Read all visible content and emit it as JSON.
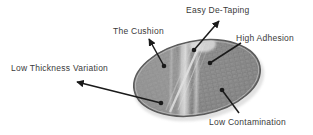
{
  "figure": {
    "background_color": "#ffffff",
    "text_color": "#3a3a3a",
    "leader_line_color": "#1a1a1a",
    "wafer": {
      "fill_color": "#9a9a9a",
      "edge_color": "#4d4d4d",
      "tape_highlight_color": "#f2f2f2",
      "die_grid_color": "#7a7a7a"
    }
  },
  "callouts": [
    {
      "id": "easy-de-taping",
      "label": "Easy De-Taping",
      "arrow_from": {
        "x": 194,
        "y": 50
      },
      "arrow_to": {
        "x": 219,
        "y": 21
      }
    },
    {
      "id": "the-cushion",
      "label": "The Cushion",
      "arrow_from": {
        "x": 164,
        "y": 66
      },
      "arrow_to": {
        "x": 149,
        "y": 39
      }
    },
    {
      "id": "high-adhesion",
      "label": "High Adhesion",
      "arrow_from": {
        "x": 241,
        "y": 43
      },
      "arrow_to": {
        "x": 210,
        "y": 63
      }
    },
    {
      "id": "low-thickness-variation",
      "label": "Low Thickness Variation",
      "arrow_from": {
        "x": 161,
        "y": 103
      },
      "arrow_to": {
        "x": 77,
        "y": 82
      }
    },
    {
      "id": "low-contamination",
      "label": "Low Contamination",
      "arrow_from": {
        "x": 239,
        "y": 113
      },
      "arrow_to": {
        "x": 222,
        "y": 90
      }
    }
  ]
}
